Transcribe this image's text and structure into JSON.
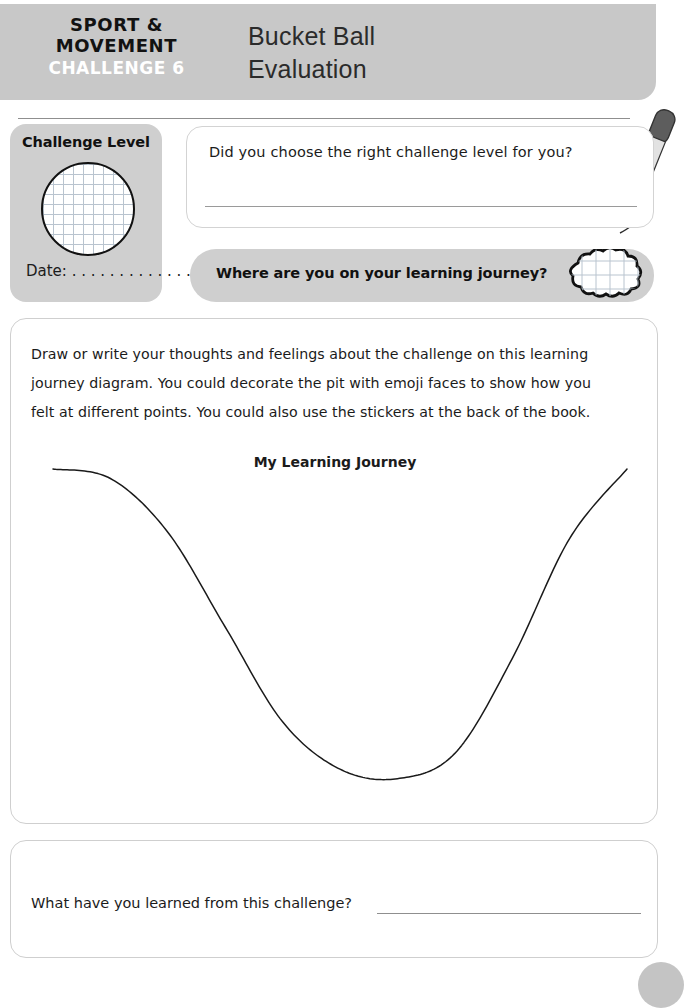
{
  "header": {
    "brand_line_1": "SPORT &",
    "brand_line_2": "MOVEMENT",
    "challenge_number": "CHALLENGE 6",
    "title_line_1": "Bucket Ball",
    "title_line_2": "Evaluation",
    "bar_color": "#c8c8c8",
    "challenge_number_color": "#ffffff"
  },
  "pen": {
    "icon": "pen-icon",
    "body_color": "#5a5a5a",
    "barrel_color": "#d8d8d8"
  },
  "challenge_level": {
    "title": "Challenge Level",
    "circle_icon": "grid-circle-icon",
    "date_label": "Date: . . . . . . . . . . . . .",
    "card_color": "#cfcfcf"
  },
  "question_1": {
    "text": "Did you choose the right challenge level for you?",
    "answer_value": "",
    "answer_placeholder": ""
  },
  "journey_bar": {
    "text": "Where are you on your learning journey?",
    "cloud_icon": "cloud-sticker-icon",
    "bar_color": "#cfcfcf"
  },
  "main_panel": {
    "instructions": [
      "Draw or write your thoughts and feelings about the challenge on this learning",
      "journey diagram. You could decorate the pit with emoji faces to show how you",
      "felt at different points. You could also use the stickers at the back of the book."
    ]
  },
  "chart_data": {
    "type": "line",
    "title": "My Learning Journey",
    "xlabel": "",
    "ylabel": "",
    "grid": false,
    "legend": null,
    "x": [
      0,
      10,
      20,
      30,
      40,
      50,
      60,
      70,
      80,
      90,
      100
    ],
    "values": [
      100,
      97,
      80,
      50,
      20,
      5,
      2,
      10,
      40,
      78,
      100
    ],
    "xlim": [
      0,
      100
    ],
    "ylim": [
      0,
      100
    ],
    "annotation": "learning pit U-curve"
  },
  "question_2": {
    "text": "What have you learned from this challenge?",
    "answer_value": "",
    "answer_placeholder": ""
  }
}
